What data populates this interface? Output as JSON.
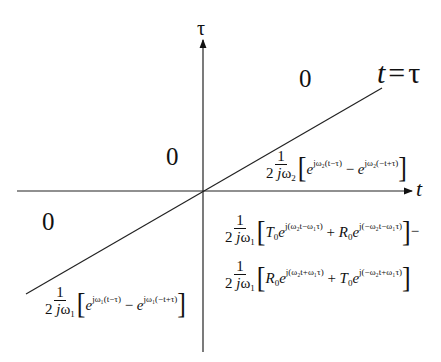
{
  "diagram": {
    "axes": {
      "vertical_label": "τ",
      "horizontal_label": "t"
    },
    "boundary_line": {
      "label_lhs": "t",
      "label_eq": "=",
      "label_rhs": "τ"
    },
    "regions": {
      "top_right_zero": "0",
      "top_left_zero": "0",
      "bottom_left_zero": "0"
    },
    "formulas": {
      "quadrant1_below_line": {
        "num": "1",
        "den_a": "2",
        "den_j": "j",
        "den_w": "ω",
        "den_sub": "2",
        "term1_exp": "jω₂(t−τ)",
        "op": "−",
        "term2_exp": "jω₂(−t+τ)"
      },
      "quadrant4_line1": {
        "num": "1",
        "den_a": "2",
        "den_j": "j",
        "den_w": "ω",
        "den_sub": "1",
        "c1": "T",
        "c1_sub": "0",
        "term1_exp": "j(ω₂t−ω₁τ)",
        "op": "+",
        "c2": "R",
        "c2_sub": "0",
        "term2_exp": "j(−ω₂t−ω₁τ)",
        "trail": "−"
      },
      "quadrant4_line2": {
        "num": "1",
        "den_a": "2",
        "den_j": "j",
        "den_w": "ω",
        "den_sub": "1",
        "c1": "R",
        "c1_sub": "0",
        "term1_exp": "j(ω₂t+ω₁τ)",
        "op": "+",
        "c2": "T",
        "c2_sub": "0",
        "term2_exp": "j(−ω₂t+ω₁τ)"
      },
      "quadrant3_below_line": {
        "num": "1",
        "den_a": "2",
        "den_j": "j",
        "den_w": "ω",
        "den_sub": "1",
        "term1_exp": "jω₁(t−τ)",
        "op": "−",
        "term2_exp": "jω₁(−t+τ)"
      }
    },
    "colors": {
      "ink": "#111111",
      "background": "#ffffff"
    }
  }
}
